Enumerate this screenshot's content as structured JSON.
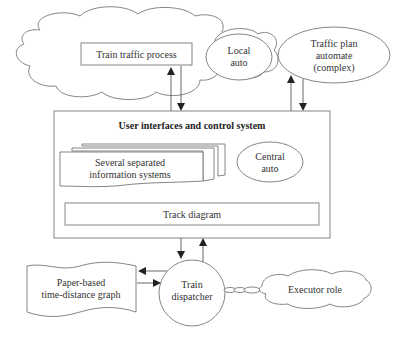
{
  "diagram": {
    "nodes": {
      "train_traffic_process": {
        "label": "Train traffic process"
      },
      "local_auto": {
        "lines": [
          "Local",
          "auto"
        ]
      },
      "traffic_plan": {
        "lines": [
          "Traffic plan",
          "automate",
          "(complex)"
        ]
      },
      "ui_control_system": {
        "title": "User interfaces and control system"
      },
      "info_systems": {
        "lines": [
          "Several separated",
          "information systems"
        ]
      },
      "central_auto": {
        "lines": [
          "Central",
          "auto"
        ]
      },
      "track_diagram": {
        "label": "Track diagram"
      },
      "paper_graph": {
        "lines": [
          "Paper-based",
          "time-distance graph"
        ]
      },
      "train_dispatcher": {
        "lines": [
          "Train",
          "dispatcher"
        ]
      },
      "executor_role": {
        "label": "Executor role"
      }
    },
    "edges": [
      {
        "from": "ui_control_system",
        "to": "train_traffic_process",
        "type": "arrow"
      },
      {
        "from": "train_traffic_process",
        "to": "ui_control_system",
        "type": "arrow"
      },
      {
        "from": "ui_control_system",
        "to": "traffic_plan",
        "type": "arrow"
      },
      {
        "from": "traffic_plan",
        "to": "ui_control_system",
        "type": "arrow"
      },
      {
        "from": "ui_control_system",
        "to": "train_dispatcher",
        "type": "arrow"
      },
      {
        "from": "train_dispatcher",
        "to": "ui_control_system",
        "type": "arrow"
      },
      {
        "from": "train_dispatcher",
        "to": "paper_graph",
        "type": "arrow"
      },
      {
        "from": "paper_graph",
        "to": "train_dispatcher",
        "type": "arrow"
      },
      {
        "from": "train_dispatcher",
        "to": "executor_role",
        "type": "chain-link"
      }
    ]
  }
}
